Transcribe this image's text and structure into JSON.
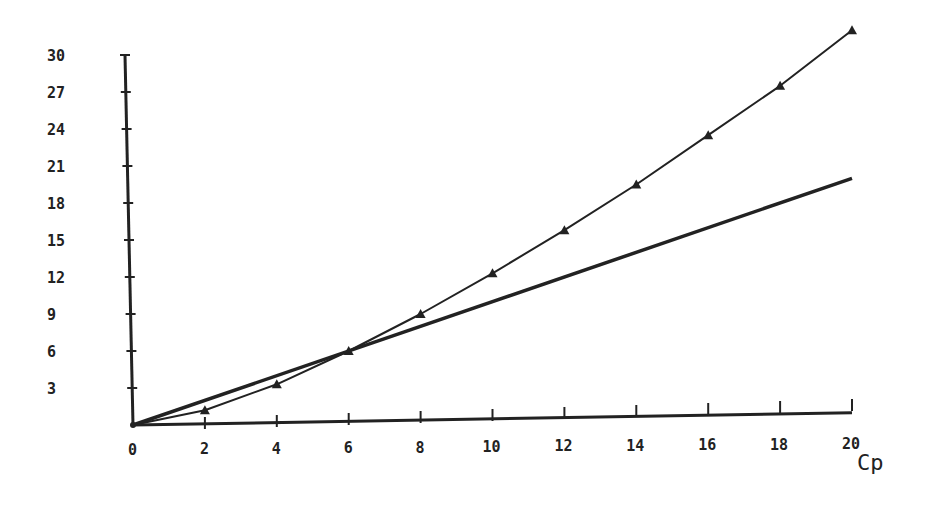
{
  "chart_data": {
    "type": "line",
    "title": "",
    "xlabel": "Cp",
    "ylabel": "",
    "xlim": [
      0,
      20
    ],
    "ylim": [
      0,
      30
    ],
    "grid": false,
    "legend": null,
    "x_ticks": [
      "0",
      "2",
      "4",
      "6",
      "8",
      "10",
      "12",
      "14",
      "16",
      "18",
      "20"
    ],
    "y_ticks": [
      "3",
      "6",
      "9",
      "12",
      "15",
      "18",
      "21",
      "24",
      "27",
      "30"
    ],
    "series": [
      {
        "name": "curve-with-triangle-markers",
        "marker": "triangle",
        "x": [
          0,
          2,
          4,
          6,
          8,
          10,
          12,
          14,
          16,
          18,
          20
        ],
        "values": [
          0,
          1.2,
          3.3,
          6.0,
          9.0,
          12.3,
          15.8,
          19.5,
          23.5,
          27.5,
          32.0
        ]
      },
      {
        "name": "straight-line-y-equals-x",
        "marker": "none",
        "x": [
          0,
          20
        ],
        "values": [
          0,
          20
        ]
      },
      {
        "name": "baseline-line",
        "marker": "none",
        "x": [
          0,
          20
        ],
        "values": [
          0,
          1.0
        ]
      }
    ]
  },
  "colors": {
    "ink": "#222222",
    "background": "#ffffff"
  }
}
